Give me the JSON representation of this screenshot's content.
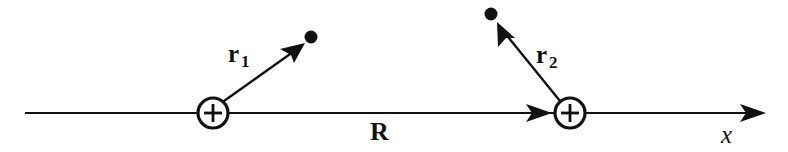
{
  "figure": {
    "background_color": "#ffffff",
    "ink_color": "#111111",
    "width": 788,
    "height": 152
  },
  "axis": {
    "name": "x-axis",
    "label": "x",
    "label_x": 721,
    "label_y": 122,
    "start_x": 25,
    "end_x": 766,
    "y": 113,
    "stroke_width": 2.2,
    "arrow_at": "end"
  },
  "charges": [
    {
      "id": "charge-left",
      "symbol": "+",
      "cx": 213,
      "cy": 113,
      "r": 15,
      "stroke_width": 3.2
    },
    {
      "id": "charge-right",
      "symbol": "+",
      "cx": 570,
      "cy": 113,
      "r": 15,
      "stroke_width": 3.2
    }
  ],
  "field_points": [
    {
      "id": "field-point-1",
      "cx": 311,
      "cy": 37,
      "r": 6.5
    },
    {
      "id": "field-point-2",
      "cx": 491,
      "cy": 14,
      "r": 6.5
    }
  ],
  "vectors": [
    {
      "id": "vector-r1",
      "label": "r",
      "subscript": "1",
      "from_x": 224,
      "from_y": 101,
      "to_x": 304,
      "to_y": 44,
      "label_x": 228,
      "label_y": 41,
      "stroke_width": 2.4
    },
    {
      "id": "vector-r2",
      "label": "r",
      "subscript": "2",
      "from_x": 560,
      "from_y": 101,
      "to_x": 498,
      "to_y": 23,
      "label_x": 536,
      "label_y": 42,
      "stroke_width": 2.4
    },
    {
      "id": "vector-R",
      "label": "R",
      "subscript": "",
      "from_x": 228,
      "from_y": 113,
      "to_x": 552,
      "to_y": 113,
      "label_x": 370,
      "label_y": 119,
      "stroke_width": 2.2
    }
  ]
}
